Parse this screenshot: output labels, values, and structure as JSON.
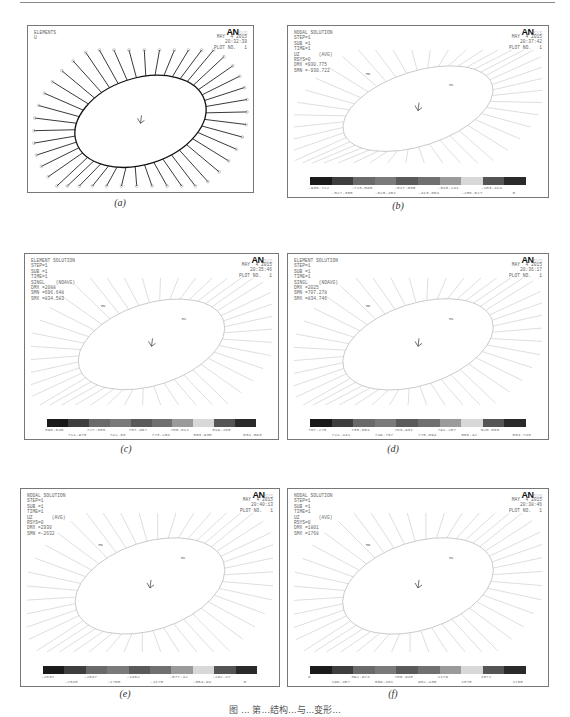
{
  "figure": {
    "caption_visible": "图 ... 第...结构...与...变形...",
    "brand": "AN",
    "brand_suffix": "SYS"
  },
  "panels": [
    {
      "id": "a",
      "label": "(a)",
      "title": "ELEMENTS",
      "info_lines": [
        "U"
      ],
      "date": "MAY  4 2015",
      "time": "20:32:39",
      "plot_no": "PLOT NO.   1",
      "style": "elements",
      "legend": null
    },
    {
      "id": "b",
      "label": "(b)",
      "title": "NODAL SOLUTION",
      "info_lines": [
        "STEP=1",
        "SUB =1",
        "TIME=1",
        "UZ       (AVG)",
        "RSYS=0",
        "DMX =930.775",
        "SMN =-930.722"
      ],
      "date": "MAY  4 2015",
      "time": "20:37:42",
      "plot_no": "PLOT NO.   1",
      "style": "solution",
      "legend": {
        "upper": [
          "-930.722",
          "-723.895",
          "-517.068",
          "-310.241",
          "-103.414"
        ],
        "lower": [
          "-827.308",
          "-620.481",
          "-413.654",
          "-206.827",
          "0"
        ]
      }
    },
    {
      "id": "c",
      "label": "(c)",
      "title": "ELEMENT SOLUTION",
      "info_lines": [
        "STEP=1",
        "SUB =1",
        "TIME=1",
        "SINGL    (NOAVG)",
        "DMX =2088",
        "SMN =696.648",
        "SMX =834.583"
      ],
      "date": "MAY  4 2015",
      "time": "20:35:46",
      "plot_no": "PLOT NO.   1",
      "style": "solution",
      "legend": {
        "upper": [
          "696.648",
          "727.303",
          "757.957",
          "788.611",
          "819.265"
        ],
        "lower": [
          "711.975",
          "742.63",
          "773.284",
          "803.938",
          "834.593"
        ]
      }
    },
    {
      "id": "d",
      "label": "(d)",
      "title": "ELEMENT SOLUTION",
      "info_lines": [
        "STEP=1",
        "SUB =1",
        "TIME=1",
        "SINGL    (NOAVG)",
        "DMX =2025",
        "SMN =707.278",
        "SMX =834.746"
      ],
      "date": "MAY  4 2015",
      "time": "20:36:17",
      "plot_no": "PLOT NO.   1",
      "style": "solution",
      "legend": {
        "upper": [
          "707.278",
          "735.604",
          "763.931",
          "792.257",
          "820.583"
        ],
        "lower": [
          "721.441",
          "749.767",
          "778.094",
          "806.42",
          "834.746"
        ]
      }
    },
    {
      "id": "e",
      "label": "(e)",
      "title": "NODAL SOLUTION",
      "info_lines": [
        "STEP=1",
        "SUB =1",
        "TIME=1",
        "UZ       (AVG)",
        "RSYS=0",
        "DMX =2930",
        "SMN =-2632"
      ],
      "date": "MAY  4 2015",
      "time": "20:40:13",
      "plot_no": "PLOT NO.   1",
      "style": "solution",
      "legend": {
        "upper": [
          "-2632",
          "-2047",
          "-1462",
          "-877.42",
          "-292.47"
        ],
        "lower": [
          "-2340",
          "-1755",
          "-1170",
          "-584.94",
          "0"
        ]
      }
    },
    {
      "id": "f",
      "label": "(f)",
      "title": "NODAL SOLUTION",
      "info_lines": [
        "STEP=1",
        "SUB =1",
        "TIME=1",
        "UZ       (AVG)",
        "RSYS=0",
        "DMX =1801",
        "SMX =1768"
      ],
      "date": "MAY  4 2015",
      "time": "20:38:46",
      "plot_no": "PLOT NO.   1",
      "style": "solution",
      "legend": {
        "upper": [
          "0",
          "392.974",
          "785.948",
          "1179",
          "1572"
        ],
        "lower": [
          "196.487",
          "589.461",
          "982.435",
          "1375",
          "1768"
        ]
      }
    }
  ],
  "legend_colors": [
    "#1a1a1a",
    "#3e3e3e",
    "#6a6a6a",
    "#7a7a7a",
    "#5a5a5a",
    "#707070",
    "#9a9a9a",
    "#d8d8d8",
    "#555555",
    "#2a2a2a"
  ]
}
